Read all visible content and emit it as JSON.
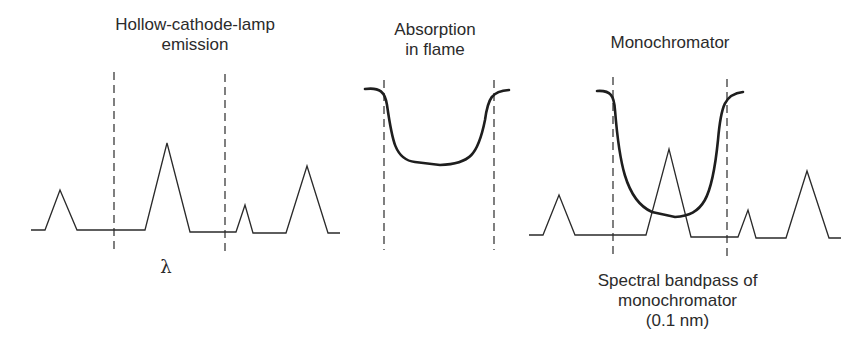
{
  "panels": [
    {
      "id": "hollow-cathode-lamp-emission",
      "title_line1": "Hollow-cathode-lamp",
      "title_line2": "emission",
      "axis_label": "λ"
    },
    {
      "id": "absorption-in-flame",
      "title_line1": "Absorption",
      "title_line2": "in flame"
    },
    {
      "id": "monochromator",
      "title_line1": "Monochromator",
      "caption_line1": "Spectral bandpass of",
      "caption_line2": "monochromator",
      "caption_line3": "(0.1 nm)"
    }
  ],
  "colors": {
    "line": "#2a2a2a",
    "background": "#ffffff"
  }
}
